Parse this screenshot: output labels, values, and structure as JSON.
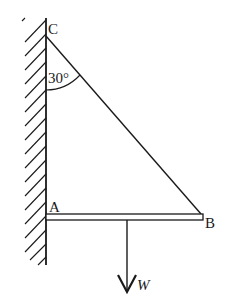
{
  "diagram": {
    "type": "statics-free-body",
    "points": {
      "C": {
        "label": "C"
      },
      "A": {
        "label": "A"
      },
      "B": {
        "label": "B"
      }
    },
    "angle": {
      "label": "30°",
      "between": "wall and string CB at C"
    },
    "load": {
      "label": "W",
      "direction": "down"
    },
    "colors": {
      "stroke": "#1a1a1a",
      "background": "#ffffff"
    }
  }
}
